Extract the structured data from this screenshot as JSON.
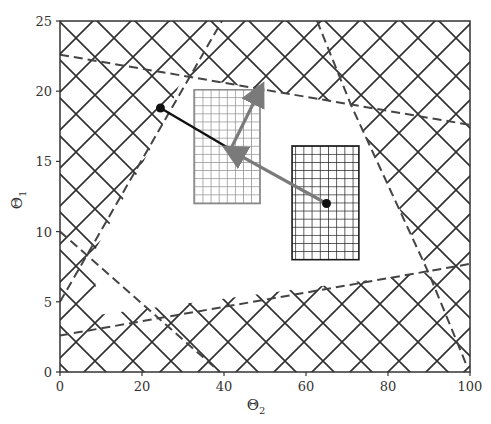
{
  "chart_data": {
    "type": "scatter",
    "title": "",
    "xlabel": "Θ",
    "xlabel_subscript": "2",
    "ylabel": "Θ",
    "ylabel_subscript": "1",
    "xlim": [
      0,
      100
    ],
    "ylim": [
      0,
      25
    ],
    "x_ticks": [
      0,
      20,
      40,
      60,
      80,
      100
    ],
    "y_ticks": [
      0,
      5,
      10,
      15,
      20,
      25
    ],
    "grid": false,
    "hatch": "crosshatch-diagonal",
    "feasible_region_boundary_lines": [
      {
        "name": "top-constraint",
        "points": [
          [
            0,
            22.6
          ],
          [
            100,
            17.6
          ]
        ]
      },
      {
        "name": "bottom-constraint",
        "points": [
          [
            0,
            2.6
          ],
          [
            100,
            7.7
          ]
        ]
      },
      {
        "name": "left-rising-constraint",
        "points": [
          [
            0,
            5.0
          ],
          [
            39.5,
            25
          ]
        ]
      },
      {
        "name": "left-falling-constraint",
        "points": [
          [
            0,
            10.0
          ],
          [
            39.0,
            0
          ]
        ]
      },
      {
        "name": "right-constraint",
        "points": [
          [
            62.7,
            25
          ],
          [
            71,
            19
          ],
          [
            90,
            7
          ],
          [
            99,
            0.6
          ]
        ]
      }
    ],
    "feasible_region_polygon": [
      [
        24.3,
        17.1
      ],
      [
        30,
        21.1
      ],
      [
        71,
        19
      ],
      [
        90,
        7.1
      ],
      [
        10,
        4.1
      ],
      [
        7.5,
        8.1
      ]
    ],
    "rectangles": [
      {
        "name": "gray-grid-box",
        "x": [
          32.7,
          48.8
        ],
        "y": [
          12.0,
          20.1
        ],
        "color": "#8a8a8a"
      },
      {
        "name": "black-grid-box",
        "x": [
          56.6,
          72.9
        ],
        "y": [
          8.0,
          16.1
        ],
        "color": "#1a1a1a"
      }
    ],
    "points": [
      {
        "name": "black-start",
        "x": 24.5,
        "y": 18.8,
        "color": "#111111"
      },
      {
        "name": "black-end",
        "x": 65.0,
        "y": 12.0,
        "color": "#111111"
      },
      {
        "name": "gray-end",
        "x": 48.8,
        "y": 20.1,
        "color": "#7a7a7a"
      }
    ],
    "paths": [
      {
        "name": "black-path",
        "from": [
          24.5,
          18.8
        ],
        "to": [
          42.0,
          15.8
        ],
        "color": "#111111",
        "arrow": false
      },
      {
        "name": "gray-arrow-left",
        "from": [
          65.0,
          12.0
        ],
        "to": [
          41.5,
          15.8
        ],
        "color": "#7a7a7a",
        "arrow": true
      },
      {
        "name": "gray-arrow-up",
        "from": [
          41.5,
          15.8
        ],
        "to": [
          48.8,
          20.1
        ],
        "color": "#7a7a7a",
        "arrow": true
      }
    ]
  },
  "colors": {
    "axis": "#333333",
    "hatch": "#2f2f2f",
    "dash": "#444444",
    "gray": "#7a7a7a",
    "black": "#111111"
  }
}
